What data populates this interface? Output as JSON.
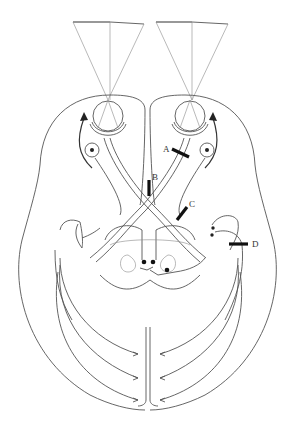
{
  "diagram": {
    "type": "visual pathway schematic (brain, eyes, optic tracts)",
    "lesion_labels": [
      {
        "id": "A",
        "label": "A"
      },
      {
        "id": "B",
        "label": "B"
      },
      {
        "id": "C",
        "label": "C"
      },
      {
        "id": "D",
        "label": "D"
      }
    ],
    "colors": {
      "background": "#ffffff",
      "line": "#555555",
      "thin_line": "#8a8a8a",
      "lesion_bar": "#111111"
    }
  }
}
